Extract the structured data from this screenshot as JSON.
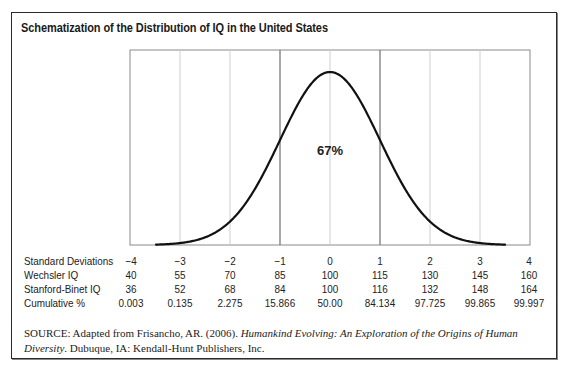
{
  "chart_data": {
    "type": "line",
    "title": "Schematization of the Distribution of IQ in the United States",
    "x": [
      -4,
      -3,
      -2,
      -1,
      0,
      1,
      2,
      3,
      4
    ],
    "xlabel": "Standard Deviations",
    "ylabel": "",
    "xlim": [
      -4,
      4
    ],
    "grid": true,
    "annotations": [
      {
        "text": "67%",
        "x": 0,
        "note": "area between -1 and +1 SD"
      }
    ],
    "table": {
      "rows": [
        {
          "label": "Standard Deviations",
          "values": [
            "−4",
            "−3",
            "−2",
            "−1",
            "0",
            "1",
            "2",
            "3",
            "4"
          ]
        },
        {
          "label": "Wechsler IQ",
          "values": [
            "40",
            "55",
            "70",
            "85",
            "100",
            "115",
            "130",
            "145",
            "160"
          ]
        },
        {
          "label": "Stanford-Binet IQ",
          "values": [
            "36",
            "52",
            "68",
            "84",
            "100",
            "116",
            "132",
            "148",
            "164"
          ]
        },
        {
          "label": "Cumulative %",
          "values": [
            "0.003",
            "0.135",
            "2.275",
            "15.866",
            "50.00",
            "84.134",
            "97.725",
            "99.865",
            "99.997"
          ]
        }
      ]
    }
  },
  "figure": {
    "title": "Schematization of the Distribution of IQ in the United States",
    "annotation": "67%",
    "source": {
      "label": "SOURCE:",
      "text_before": " Adapted from Frisancho, AR. (2006). ",
      "book_title": "Humankind Evolving: An Exploration of the Origins of Human Diversity",
      "text_after": ". Dubuque, IA: Kendall-Hunt Publishers, Inc."
    }
  },
  "table": {
    "row_labels": [
      "Standard Deviations",
      "Wechsler IQ",
      "Stanford-Binet IQ",
      "Cumulative %"
    ],
    "sd": [
      "−4",
      "−3",
      "−2",
      "−1",
      "0",
      "1",
      "2",
      "3",
      "4"
    ],
    "wechsler": [
      "40",
      "55",
      "70",
      "85",
      "100",
      "115",
      "130",
      "145",
      "160"
    ],
    "stanford_binet": [
      "36",
      "52",
      "68",
      "84",
      "100",
      "116",
      "132",
      "148",
      "164"
    ],
    "cumulative": [
      "0.003",
      "0.135",
      "2.275",
      "15.866",
      "50.00",
      "84.134",
      "97.725",
      "99.865",
      "99.997"
    ]
  },
  "colors": {
    "curve": "#111111",
    "grid_light": "#c8c8c8",
    "grid_dark": "#777777",
    "border": "#2a2a2a"
  }
}
